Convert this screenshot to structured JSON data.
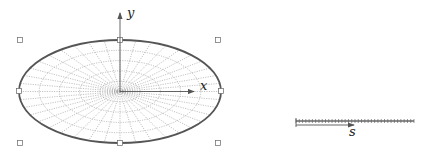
{
  "diagram": {
    "ellipse": {
      "cx": 120,
      "cy": 91.5,
      "rx": 101,
      "ry": 51.5,
      "stroke": "#555555",
      "rings": 5,
      "spokes": 40,
      "mesh_color": "#9a9a9a"
    },
    "axes": {
      "x_label": "x",
      "y_label": "y",
      "color": "#555555"
    },
    "selection_handles": [
      {
        "name": "top-left",
        "x": 20,
        "y": 40
      },
      {
        "name": "top-center",
        "x": 120,
        "y": 40
      },
      {
        "name": "top-right",
        "x": 218,
        "y": 40
      },
      {
        "name": "middle-left",
        "x": 19,
        "y": 91
      },
      {
        "name": "middle-right",
        "x": 221,
        "y": 91
      },
      {
        "name": "bottom-left",
        "x": 20,
        "y": 143
      },
      {
        "name": "bottom-center",
        "x": 120,
        "y": 143
      },
      {
        "name": "bottom-right",
        "x": 218,
        "y": 143
      }
    ],
    "segment": {
      "label": "s",
      "x1": 296,
      "x2": 414,
      "y": 121,
      "ticks": 36,
      "color": "#666666"
    }
  }
}
